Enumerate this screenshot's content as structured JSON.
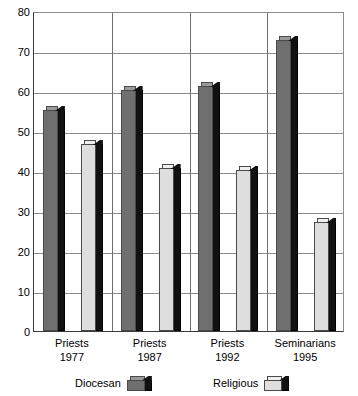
{
  "chart_data": {
    "type": "bar",
    "title": "",
    "subtitle": "",
    "xlabel": "",
    "ylabel": "",
    "ylim": [
      0,
      80
    ],
    "ytick_step": 10,
    "yticks": [
      "80",
      "70",
      "60",
      "50",
      "40",
      "30",
      "20",
      "10",
      "0"
    ],
    "grid": true,
    "grid_orientation": "both",
    "legend_position": "bottom",
    "style": "3d-grouped-columns",
    "categories": [
      {
        "line1": "Priests",
        "line2": "1977"
      },
      {
        "line1": "Priests",
        "line2": "1987"
      },
      {
        "line1": "Priests",
        "line2": "1992"
      },
      {
        "line1": "Seminarians",
        "line2": "1995"
      }
    ],
    "category_labels": [
      "Priests 1977",
      "Priests 1987",
      "Priests 1992",
      "Seminarians 1995"
    ],
    "series": [
      {
        "name": "Diocesan",
        "color": "#6f6f6f",
        "top_color": "#9a9a9a",
        "side_color": "#111111",
        "values": [
          55,
          60,
          61,
          72.5
        ]
      },
      {
        "name": "Religious",
        "color": "#dedede",
        "top_color": "#efefef",
        "side_color": "#111111",
        "values": [
          46.5,
          40.5,
          40,
          27
        ]
      }
    ],
    "legend": [
      {
        "label": "Diocesan",
        "swatch": "dark-gray-3d-box"
      },
      {
        "label": "Religious",
        "swatch": "light-gray-3d-box"
      }
    ],
    "axis_color": "#3a3a3a",
    "gridline_color": "#8a8a8a",
    "background": "#ffffff"
  }
}
